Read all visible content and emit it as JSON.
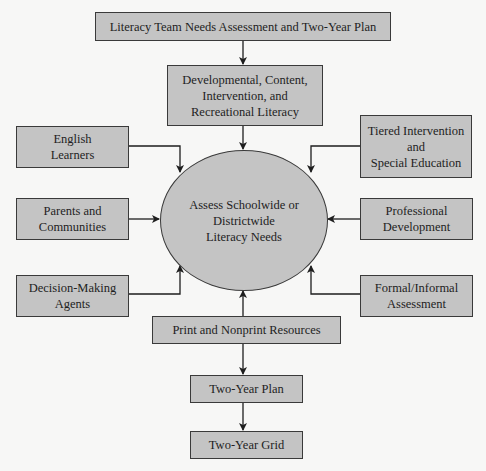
{
  "diagram": {
    "center": {
      "lines": [
        "Assess Schoolwide or",
        "Districtwide",
        "Literacy Needs"
      ]
    },
    "top": {
      "lines": [
        "Literacy Team Needs Assessment and Two-Year Plan"
      ]
    },
    "literacy_types": {
      "lines": [
        "Developmental, Content,",
        "Intervention, and",
        "Recreational Literacy"
      ]
    },
    "left_inputs": [
      {
        "lines": [
          "English",
          "Learners"
        ]
      },
      {
        "lines": [
          "Parents and",
          "Communities"
        ]
      },
      {
        "lines": [
          "Decision-Making",
          "Agents"
        ]
      }
    ],
    "right_inputs": [
      {
        "lines": [
          "Tiered Intervention",
          "and",
          "Special Education"
        ]
      },
      {
        "lines": [
          "Professional",
          "Development"
        ]
      },
      {
        "lines": [
          "Formal/Informal",
          "Assessment"
        ]
      }
    ],
    "resources": {
      "lines": [
        "Print and Nonprint Resources"
      ]
    },
    "plan": {
      "lines": [
        "Two-Year Plan"
      ]
    },
    "grid": {
      "lines": [
        "Two-Year Grid"
      ]
    }
  },
  "colors": {
    "box_fill": "#c4c4c4",
    "border": "#3a3a3a",
    "background": "#f7f7f6"
  }
}
